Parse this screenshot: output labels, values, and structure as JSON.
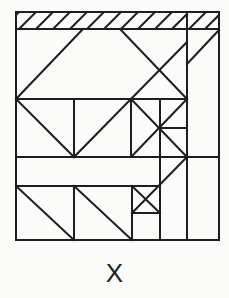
{
  "figure": {
    "label": "X",
    "stroke_color": "#1e1e1e",
    "background": "#fbfbfa",
    "frame": {
      "x1": 16,
      "y1": 12,
      "x2": 219,
      "y2": 240
    },
    "hatch_band": {
      "y1": 12,
      "y2": 29,
      "divider_x": 187
    }
  }
}
